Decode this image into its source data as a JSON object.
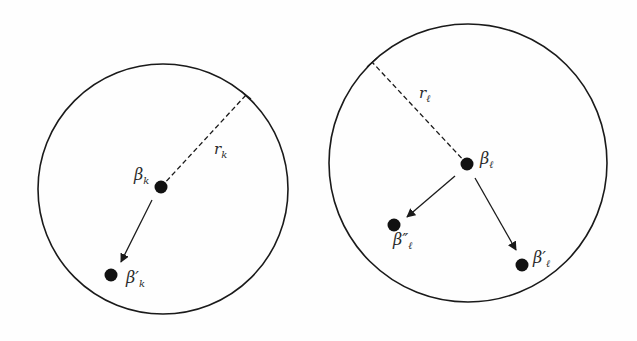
{
  "diagram": {
    "colors": {
      "stroke": "#1a1a1a",
      "dot": "#111111",
      "text": "#2a2a2a",
      "background": "#fefefe"
    },
    "left_region": {
      "center_label": "β",
      "center_sub": "k",
      "radius_label": "r",
      "radius_sub": "k",
      "moved_label": "β′",
      "moved_sub": "k"
    },
    "right_region": {
      "center_label": "β",
      "center_sub": "ℓ",
      "radius_label": "r",
      "radius_sub": "ℓ",
      "moved1_label": "β′",
      "moved1_sub": "ℓ",
      "moved2_label": "β″",
      "moved2_sub": "ℓ"
    }
  }
}
